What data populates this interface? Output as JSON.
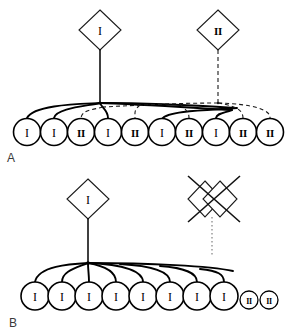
{
  "figure": {
    "background_color": "#ffffff",
    "ink_color": "#000000",
    "panels": [
      {
        "id": "A",
        "letter": "A",
        "founders": [
          {
            "name": "founder-haplotype-1",
            "shape": "diamond",
            "label": "I",
            "line_style": "solid",
            "x": 100,
            "y": 30
          },
          {
            "name": "founder-haplotype-2",
            "shape": "diamond",
            "label": "II",
            "line_style": "dashed",
            "x": 218,
            "y": 30
          }
        ],
        "junctions": [
          {
            "name": "junction-solid",
            "x": 100,
            "y": 103,
            "style": "solid"
          },
          {
            "name": "junction-dashed",
            "x": 218,
            "y": 103,
            "style": "dashed"
          }
        ],
        "offspring": [
          {
            "label": "I",
            "style": "solid",
            "x": 27,
            "y": 132,
            "r": 13.5
          },
          {
            "label": "I",
            "style": "solid",
            "x": 54,
            "y": 132,
            "r": 13.5
          },
          {
            "label": "II",
            "style": "dashed",
            "x": 81,
            "y": 132,
            "r": 13.5
          },
          {
            "label": "I",
            "style": "solid",
            "x": 108,
            "y": 132,
            "r": 13.5
          },
          {
            "label": "II",
            "style": "dashed",
            "x": 135,
            "y": 132,
            "r": 13.5
          },
          {
            "label": "I",
            "style": "solid",
            "x": 162,
            "y": 132,
            "r": 13.5
          },
          {
            "label": "II",
            "style": "dashed",
            "x": 189,
            "y": 132,
            "r": 13.5
          },
          {
            "label": "I",
            "style": "solid",
            "x": 216,
            "y": 132,
            "r": 13.5
          },
          {
            "label": "II",
            "style": "dashed",
            "x": 243,
            "y": 132,
            "r": 13.5
          },
          {
            "label": "II",
            "style": "dashed",
            "x": 270,
            "y": 132,
            "r": 13.5
          }
        ]
      },
      {
        "id": "B",
        "letter": "B",
        "founders": [
          {
            "name": "founder-haplotype-1",
            "shape": "diamond",
            "label": "I",
            "line_style": "solid",
            "x": 88,
            "y": 199
          },
          {
            "name": "founder-haplotype-2-excluded",
            "shape": "double-diamond-crossed",
            "label": "",
            "line_style": "crossed-out",
            "x": 212,
            "y": 199
          }
        ],
        "junctions": [
          {
            "name": "junction-solid",
            "x": 88,
            "y": 263,
            "style": "solid"
          }
        ],
        "offspring": [
          {
            "label": "I",
            "style": "solid",
            "x": 35,
            "y": 296,
            "r": 14
          },
          {
            "label": "I",
            "style": "solid",
            "x": 62,
            "y": 296,
            "r": 14
          },
          {
            "label": "I",
            "style": "solid",
            "x": 89,
            "y": 296,
            "r": 14
          },
          {
            "label": "I",
            "style": "solid",
            "x": 116,
            "y": 296,
            "r": 14
          },
          {
            "label": "I",
            "style": "solid",
            "x": 143,
            "y": 296,
            "r": 14
          },
          {
            "label": "I",
            "style": "solid",
            "x": 170,
            "y": 296,
            "r": 14
          },
          {
            "label": "I",
            "style": "solid",
            "x": 197,
            "y": 296,
            "r": 14
          },
          {
            "label": "I",
            "style": "solid",
            "x": 224,
            "y": 296,
            "r": 14
          }
        ],
        "extra_offspring": [
          {
            "label": "II",
            "style": "solid",
            "x": 249,
            "y": 300,
            "r": 9
          },
          {
            "label": "II",
            "style": "solid",
            "x": 269,
            "y": 300,
            "r": 9
          }
        ]
      }
    ]
  }
}
